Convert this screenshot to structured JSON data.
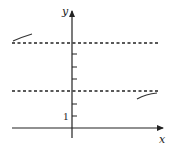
{
  "diagram": {
    "type": "function-graph-asymptotes",
    "axes": {
      "x_label": "x",
      "y_label": "y",
      "tick_label": "1"
    },
    "colors": {
      "axis": "#222222",
      "dashed": "#222222",
      "curve": "#333333",
      "background": "#ffffff"
    },
    "asymptotes": [
      {
        "name": "upper-horizontal-asymptote",
        "y_value": 7
      },
      {
        "name": "lower-horizontal-asymptote",
        "y_value": 3
      }
    ],
    "y_ticks": [
      1,
      2,
      3,
      4,
      5,
      6,
      7
    ]
  }
}
